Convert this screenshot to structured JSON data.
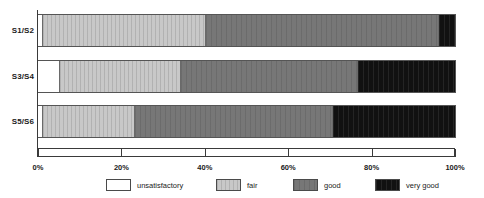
{
  "chart_data": {
    "type": "bar",
    "orientation": "horizontal",
    "stacked": true,
    "normalized": true,
    "title": "",
    "subtitle": "",
    "xlabel": "",
    "ylabel": "",
    "categories": [
      "S1/S2",
      "S3/S4",
      "S5/S6"
    ],
    "xlim": [
      0,
      100
    ],
    "xticks": [
      0,
      20,
      40,
      60,
      80,
      100
    ],
    "xtick_labels": [
      "0%",
      "20%",
      "40%",
      "60%",
      "80%",
      "100%"
    ],
    "grid": false,
    "legend_position": "bottom",
    "series": [
      {
        "name": "unsatisfactory",
        "color": "#ffffff",
        "values": [
          1,
          5,
          1
        ]
      },
      {
        "name": "fair",
        "color": "#c8c8c8",
        "values": [
          39,
          29,
          22
        ]
      },
      {
        "name": "good",
        "color": "#777777",
        "values": [
          56,
          42.5,
          47.5
        ]
      },
      {
        "name": "very good",
        "color": "#111111",
        "values": [
          4,
          23.5,
          29.5
        ]
      }
    ]
  },
  "axis": {
    "ticks": [
      {
        "label": "0%",
        "value": 0
      },
      {
        "label": "20%",
        "value": 20
      },
      {
        "label": "40%",
        "value": 40
      },
      {
        "label": "60%",
        "value": 60
      },
      {
        "label": "80%",
        "value": 80
      },
      {
        "label": "100%",
        "value": 100
      }
    ]
  },
  "legend": {
    "items": [
      {
        "label": "unsatisfactory",
        "key": "unsatisfactory"
      },
      {
        "label": "fair",
        "key": "fair"
      },
      {
        "label": "good",
        "key": "good"
      },
      {
        "label": "very good",
        "key": "verygood"
      }
    ]
  }
}
